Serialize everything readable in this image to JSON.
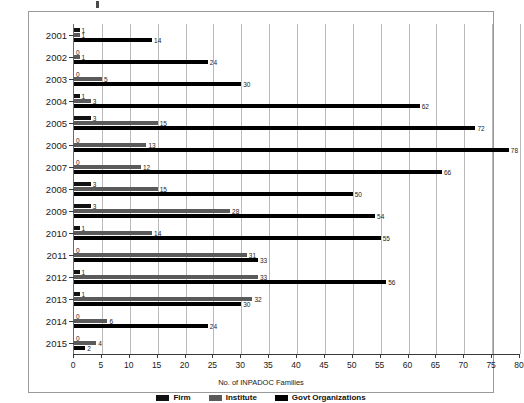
{
  "chart_data": {
    "type": "bar",
    "orientation": "horizontal",
    "title": "",
    "xlabel": "No. of INPADOC Families",
    "ylabel": "",
    "xlim": [
      0,
      80
    ],
    "xticks": [
      0,
      5,
      10,
      15,
      20,
      25,
      30,
      35,
      40,
      45,
      50,
      55,
      60,
      65,
      70,
      75,
      80
    ],
    "grid": true,
    "legend_position": "bottom",
    "categories": [
      "2001",
      "2002",
      "2003",
      "2004",
      "2005",
      "2006",
      "2007",
      "2008",
      "2009",
      "2010",
      "2011",
      "2012",
      "2013",
      "2014",
      "2015"
    ],
    "series": [
      {
        "name": "Firm",
        "color": "#111111",
        "values": [
          1,
          0,
          0,
          1,
          3,
          0,
          0,
          3,
          3,
          1,
          0,
          1,
          1,
          0,
          0
        ]
      },
      {
        "name": "Institute",
        "color": "#5a5a5a",
        "values": [
          1,
          1,
          5,
          3,
          15,
          13,
          12,
          15,
          28,
          14,
          31,
          33,
          32,
          6,
          4
        ]
      },
      {
        "name": "Govt Organizations",
        "color": "#000000",
        "values": [
          14,
          24,
          30,
          62,
          72,
          78,
          66,
          50,
          54,
          55,
          33,
          56,
          30,
          24,
          2
        ]
      }
    ]
  },
  "legend": {
    "items": [
      {
        "label": "Firm",
        "color": "#111111"
      },
      {
        "label": "Institute",
        "color": "#5a5a5a"
      },
      {
        "label": "Govt Organizations",
        "color": "#000000"
      }
    ]
  },
  "axis": {
    "x_title": "No. of INPADOC Families"
  }
}
